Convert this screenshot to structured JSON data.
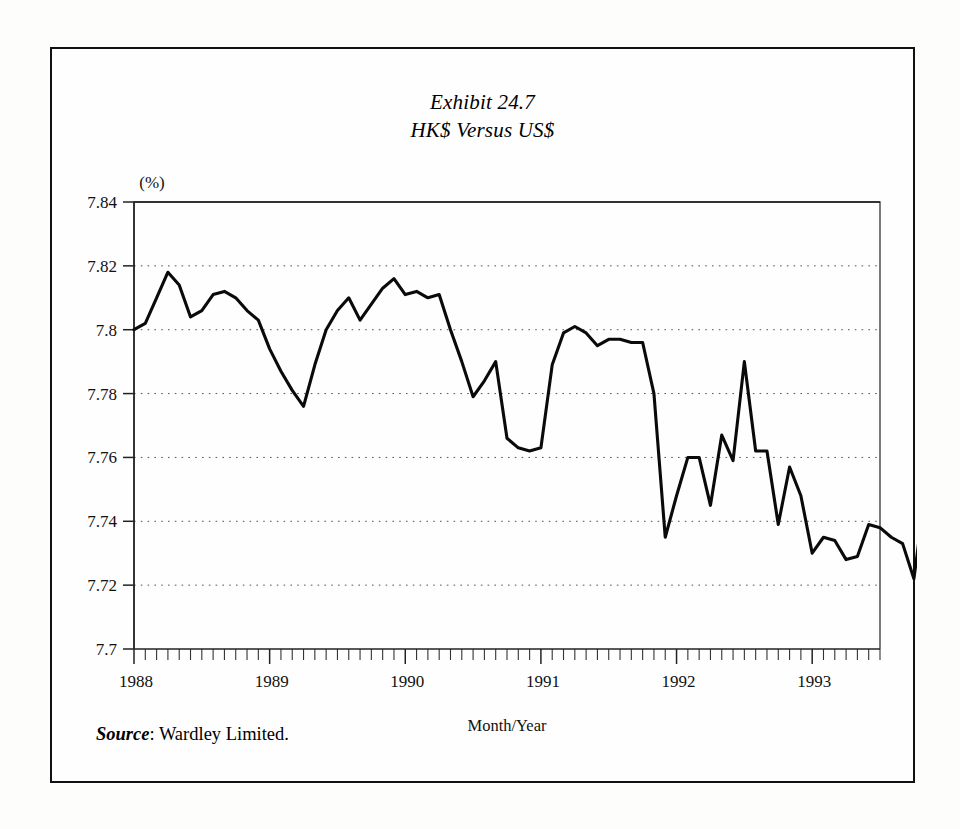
{
  "exhibit": {
    "title_line1": "Exhibit 24.7",
    "title_line2": "HK$ Versus US$",
    "source_label": "Source",
    "source_separator": ": ",
    "source_text": "Wardley Limited."
  },
  "chart_data": {
    "type": "line",
    "title": "HK$ Versus US$",
    "subtitle": "Exhibit 24.7",
    "xlabel": "Month/Year",
    "ylabel": "(%)",
    "unit_label": "(%)",
    "grid": true,
    "legend": "none",
    "ylim": [
      7.7,
      7.84
    ],
    "ytick_labels": [
      "7.7",
      "7.72",
      "7.74",
      "7.76",
      "7.78",
      "7.8",
      "7.82",
      "7.84"
    ],
    "yticks": [
      7.7,
      7.72,
      7.74,
      7.76,
      7.78,
      7.8,
      7.82,
      7.84
    ],
    "xtick_labels": [
      "1988",
      "1989",
      "1990",
      "1991",
      "1992",
      "1993"
    ],
    "xticks": [
      0,
      12,
      24,
      36,
      48,
      60
    ],
    "x_minor_interval_months": 1,
    "xlim_months": [
      0,
      66
    ],
    "series": [
      {
        "name": "HK$/US$ exchange rate",
        "color": "#0a0a0a",
        "x": [
          0,
          1,
          2,
          3,
          4,
          5,
          6,
          7,
          8,
          9,
          10,
          11,
          12,
          13,
          14,
          15,
          16,
          17,
          18,
          19,
          20,
          21,
          22,
          23,
          24,
          25,
          26,
          27,
          28,
          29,
          30,
          31,
          32,
          33,
          34,
          35,
          36,
          37,
          38,
          39,
          40,
          41,
          42,
          43,
          44,
          45,
          46,
          47,
          48,
          49,
          50,
          51,
          52,
          53,
          54,
          55,
          56,
          57,
          58,
          59,
          60,
          61,
          62,
          63,
          64,
          65,
          66
        ],
        "values": [
          7.8,
          7.802,
          7.81,
          7.818,
          7.814,
          7.804,
          7.806,
          7.811,
          7.812,
          7.81,
          7.806,
          7.803,
          7.794,
          7.787,
          7.781,
          7.776,
          7.789,
          7.8,
          7.806,
          7.81,
          7.803,
          7.808,
          7.813,
          7.816,
          7.811,
          7.812,
          7.81,
          7.811,
          7.8,
          7.79,
          7.779,
          7.784,
          7.79,
          7.766,
          7.763,
          7.762,
          7.763,
          7.789,
          7.799,
          7.801,
          7.799,
          7.795,
          7.797,
          7.797,
          7.796,
          7.796,
          7.78,
          7.735,
          7.748,
          7.76,
          7.76,
          7.745,
          7.767,
          7.759,
          7.79,
          7.762,
          7.762,
          7.739,
          7.757,
          7.748,
          7.73,
          7.735,
          7.734,
          7.728,
          7.729,
          7.739,
          7.738
        ],
        "values_tail": [
          7.735,
          7.733,
          7.722,
          7.749
        ]
      }
    ],
    "annotations": []
  }
}
